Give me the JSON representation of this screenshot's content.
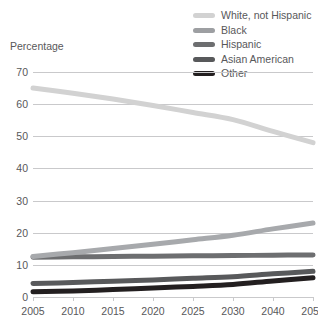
{
  "chart_data": {
    "type": "line",
    "title": "",
    "ylabel": "Percentage",
    "xlabel": "",
    "ylim": [
      0,
      70
    ],
    "yticks": [
      0,
      10,
      20,
      30,
      40,
      50,
      60,
      70
    ],
    "grid": true,
    "legend_position": "top-right",
    "categories": [
      "2005",
      "2010",
      "2015",
      "2020",
      "2025",
      "2030",
      "2040",
      "2050"
    ],
    "x": [
      2005,
      2010,
      2015,
      2020,
      2025,
      2030,
      2040,
      2050
    ],
    "series": [
      {
        "name": "White, not Hispanic",
        "color": "#d2d2d2",
        "values": [
          65.0,
          63.4,
          61.6,
          59.6,
          57.4,
          55.2,
          51.5,
          48.0
        ]
      },
      {
        "name": "Black",
        "color": "#6d6e70",
        "values": [
          12.4,
          12.5,
          12.6,
          12.7,
          12.8,
          12.9,
          13.0,
          13.1
        ]
      },
      {
        "name": "Hispanic",
        "color": "#a7a9ac",
        "values": [
          12.6,
          13.8,
          15.1,
          16.4,
          17.8,
          19.2,
          21.2,
          23.0
        ]
      },
      {
        "name": "Asian American",
        "color": "#58595b",
        "values": [
          4.2,
          4.5,
          4.9,
          5.3,
          5.8,
          6.3,
          7.2,
          8.0
        ]
      },
      {
        "name": "Other",
        "color": "#231f20",
        "values": [
          1.6,
          1.9,
          2.3,
          2.8,
          3.3,
          3.9,
          5.0,
          6.0
        ]
      }
    ]
  },
  "legend": {
    "items": [
      {
        "label": "White, not Hispanic",
        "color": "#d2d2d2"
      },
      {
        "label": "Black",
        "color": "#9d9fa2"
      },
      {
        "label": "Hispanic",
        "color": "#6d6e70"
      },
      {
        "label": "Asian American",
        "color": "#58595b"
      },
      {
        "label": "Other",
        "color": "#231f20"
      }
    ]
  },
  "axes": {
    "y_title": "Percentage",
    "y_labels": [
      "70",
      "60",
      "50",
      "40",
      "30",
      "20",
      "10",
      "0"
    ],
    "x_labels": [
      "2005",
      "2010",
      "2015",
      "2020",
      "2025",
      "2030",
      "2040",
      "2050"
    ]
  }
}
